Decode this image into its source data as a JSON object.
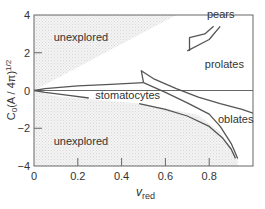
{
  "chart_data": {
    "type": "line",
    "title": "",
    "xlabel": "v",
    "xlabel_subscript": "red",
    "ylabel": "C₀(A / 4π)¹ᐟ²",
    "ylabel_parts": {
      "base": "C",
      "sub": "0",
      "mid": "(A / 4π)",
      "sup": "1/2"
    },
    "xlim": [
      0,
      1.0
    ],
    "ylim": [
      -4,
      4
    ],
    "x_ticks": [
      0,
      0.2,
      0.4,
      0.6,
      0.8
    ],
    "x_tick_labels": [
      "0",
      "0.2",
      "0.4",
      "0.6",
      "0.8"
    ],
    "y_ticks": [
      -4,
      -2,
      0,
      2,
      4
    ],
    "y_tick_labels": [
      "−4",
      "−2",
      "0",
      "2",
      "4"
    ],
    "grid": false,
    "legend": null,
    "reference_lines": [
      {
        "axis": "y",
        "value": 0
      }
    ],
    "shaded_regions": [
      {
        "label": "unexplored",
        "position": "upper-left",
        "polygon": [
          [
            0,
            0
          ],
          [
            0,
            4
          ],
          [
            0.65,
            4
          ]
        ]
      },
      {
        "label": "unexplored",
        "position": "lower",
        "polygon": [
          [
            0,
            0
          ],
          [
            0.1,
            -0.3
          ],
          [
            0.5,
            -0.7
          ],
          [
            0.75,
            -1.3
          ],
          [
            0.85,
            -2.2
          ],
          [
            0.93,
            -3.6
          ],
          [
            0.93,
            -4
          ],
          [
            0,
            -4
          ]
        ]
      }
    ],
    "region_labels": [
      {
        "text": "unexplored",
        "x": 0.09,
        "y": 2.6
      },
      {
        "text": "unexplored",
        "x": 0.09,
        "y": -2.9
      },
      {
        "text": "pears",
        "x": 0.79,
        "y": 3.85
      },
      {
        "text": "prolates",
        "x": 0.78,
        "y": 1.2
      },
      {
        "text": "stomatocytes",
        "x": 0.28,
        "y": -0.45
      },
      {
        "text": "oblates",
        "x": 0.84,
        "y": -1.7
      }
    ],
    "series": [
      {
        "name": "stomatocyte-upper-boundary",
        "x": [
          0,
          0.05,
          0.2,
          0.35,
          0.5
        ],
        "y": [
          0,
          0.1,
          0.25,
          0.33,
          0.42
        ]
      },
      {
        "name": "stomatocyte-lower-boundary",
        "x": [
          0,
          0.05,
          0.15,
          0.25
        ],
        "y": [
          0,
          -0.1,
          -0.25,
          -0.4
        ]
      },
      {
        "name": "prolate-oblate-upper",
        "x": [
          0.5,
          0.49,
          0.55,
          0.65,
          0.75,
          0.85,
          0.95,
          1.0
        ],
        "y": [
          0.42,
          1.05,
          0.6,
          0.1,
          -0.35,
          -0.7,
          -1.0,
          -1.2
        ]
      },
      {
        "name": "prolate-oblate-middle",
        "x": [
          0.5,
          0.6,
          0.7,
          0.8,
          0.85,
          0.9,
          0.93
        ],
        "y": [
          0.42,
          -0.1,
          -0.65,
          -1.25,
          -1.9,
          -2.8,
          -3.6
        ]
      },
      {
        "name": "oblate-lower",
        "x": [
          0.48,
          0.6,
          0.7,
          0.8,
          0.86,
          0.9,
          0.92
        ],
        "y": [
          -0.7,
          -1.0,
          -1.35,
          -1.9,
          -2.5,
          -3.1,
          -3.6
        ]
      },
      {
        "name": "pears-boundary-lower",
        "x": [
          0.7,
          0.8,
          0.85
        ],
        "y": [
          2.1,
          2.7,
          3.4
        ]
      },
      {
        "name": "pears-boundary-upper",
        "x": [
          0.71,
          0.71,
          0.78,
          0.82
        ],
        "y": [
          2.1,
          2.8,
          3.0,
          3.4
        ]
      }
    ]
  }
}
